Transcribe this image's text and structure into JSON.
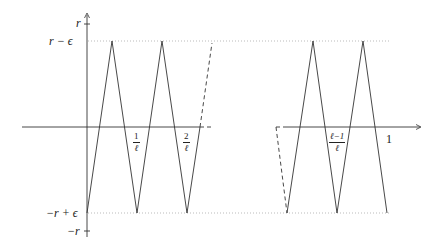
{
  "diagram": {
    "type": "piecewise-linear sawtooth plot",
    "y_labels": {
      "r": "r",
      "r_minus_eps": "r − ϵ",
      "neg_r_plus_eps": "−r + ϵ",
      "neg_r": "−r"
    },
    "x_labels": {
      "one_over_l": {
        "num": "1",
        "den": "ℓ"
      },
      "two_over_l": {
        "num": "2",
        "den": "ℓ"
      },
      "l_minus_1_over_l": {
        "num": "ℓ−1",
        "den": "ℓ"
      },
      "one": "1"
    },
    "colors": {
      "line": "#333333",
      "dotted": "#999999"
    }
  }
}
